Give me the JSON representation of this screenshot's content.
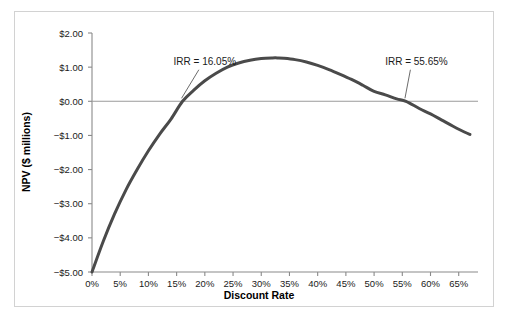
{
  "chart_data": {
    "type": "line",
    "title": "",
    "xlabel": "Discount Rate",
    "ylabel": "NPV ($ millions)",
    "xlim": [
      0,
      67
    ],
    "ylim": [
      -5.0,
      2.0
    ],
    "grid": false,
    "legend": "none",
    "x_tick_labels": [
      "0%",
      "5%",
      "10%",
      "15%",
      "20%",
      "25%",
      "30%",
      "35%",
      "40%",
      "45%",
      "50%",
      "55%",
      "60%",
      "65%"
    ],
    "x_tick_values": [
      0,
      5,
      10,
      15,
      20,
      25,
      30,
      35,
      40,
      45,
      50,
      55,
      60,
      65
    ],
    "y_tick_labels": [
      "$2.00",
      "$1.00",
      "$0.00",
      "−$1.00",
      "−$2.00",
      "−$3.00",
      "−$4.00",
      "−$5.00"
    ],
    "y_tick_values": [
      2,
      1,
      0,
      -1,
      -2,
      -3,
      -4,
      -5
    ],
    "series": [
      {
        "name": "NPV",
        "color": "#4a4a4a",
        "x": [
          0,
          2,
          4,
          6,
          8,
          10,
          12,
          14,
          16.05,
          18,
          20,
          22,
          24,
          26,
          28,
          30,
          32,
          33,
          34,
          36,
          38,
          40,
          42,
          44,
          46,
          48,
          50,
          52,
          54,
          55.65,
          58,
          60,
          62,
          64,
          66,
          67
        ],
        "values": [
          -5.0,
          -4.1,
          -3.3,
          -2.6,
          -2.0,
          -1.45,
          -0.96,
          -0.52,
          0.0,
          0.32,
          0.6,
          0.82,
          1.0,
          1.12,
          1.2,
          1.25,
          1.27,
          1.27,
          1.26,
          1.22,
          1.15,
          1.05,
          0.93,
          0.79,
          0.64,
          0.47,
          0.29,
          0.19,
          0.07,
          0.0,
          -0.21,
          -0.37,
          -0.55,
          -0.73,
          -0.9,
          -0.97
        ]
      }
    ],
    "zero_line": 0,
    "annotations": [
      {
        "name": "irr-low",
        "text": "IRR = 16.05%",
        "x": 16.05,
        "y": 0,
        "label_x": 20.0,
        "label_y": 1.07
      },
      {
        "name": "irr-high",
        "text": "IRR = 55.65%",
        "x": 55.65,
        "y": 0,
        "label_x": 57.5,
        "label_y": 1.07
      }
    ]
  },
  "axis": {
    "x_title": "Discount Rate",
    "y_title": "NPV ($ millions)"
  },
  "annotations": {
    "irr_low": "IRR = 16.05%",
    "irr_high": "IRR = 55.65%"
  },
  "ticks": {
    "x": [
      "0%",
      "5%",
      "10%",
      "15%",
      "20%",
      "25%",
      "30%",
      "35%",
      "40%",
      "45%",
      "50%",
      "55%",
      "60%",
      "65%"
    ],
    "y": [
      "$2.00",
      "$1.00",
      "$0.00",
      "−$1.00",
      "−$2.00",
      "−$3.00",
      "−$4.00",
      "−$5.00"
    ]
  },
  "colors": {
    "curve": "#4a4a4a",
    "axis": "#8a8a8a",
    "zero_line": "#9a9a9a",
    "frame": "#d2d2d2",
    "text": "#1a1a1a"
  }
}
